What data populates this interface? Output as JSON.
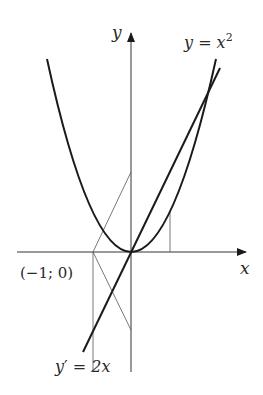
{
  "diagram": {
    "axes": {
      "x_label": "x",
      "y_label": "y"
    },
    "curves": {
      "parabola_label": "y = x",
      "parabola_exponent": "2",
      "derivative_label_y": "y",
      "derivative_label_prime": "′",
      "derivative_label_rest": " = 2x"
    },
    "points": {
      "point_label": "(−1; 0)"
    },
    "colors": {
      "thick_line": "#1a1a1a",
      "thin_line": "#555555",
      "background": "#ffffff"
    }
  }
}
